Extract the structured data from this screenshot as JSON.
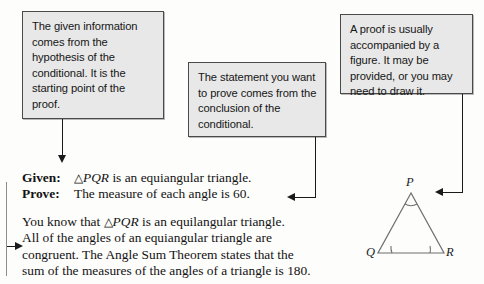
{
  "callouts": {
    "given_note": "The given information comes from the hypothesis of the conditional. It is the starting point of the proof.",
    "prove_note": "The statement you want to prove comes from the conclusion of the conditional.",
    "figure_note": "A proof is usually accompanied by a figure. It may be provided, or you may need to draw it."
  },
  "statement": {
    "given_label": "Given:",
    "given_text_pre": "△",
    "given_text_var": "PQR",
    "given_text_post": " is an equiangular triangle.",
    "prove_label": "Prove:",
    "prove_text": "The measure of each angle is 60."
  },
  "paragraph": {
    "line1_pre": "You know that ",
    "line1_sym": "△",
    "line1_var": "PQR",
    "line1_post": " is an equilangular triangle.",
    "line2": "All of the angles of an equiangular triangle are",
    "line3": "congruent. The Angle Sum Theorem states that the",
    "line4": "sum of the measures of the angles of a triangle is 180."
  },
  "figure": {
    "vertex_p": "P",
    "vertex_q": "Q",
    "vertex_r": "R"
  },
  "colors": {
    "box_fill": "#e8e8e8",
    "box_border": "#4a4a4a",
    "stroke": "#1a1a1a",
    "rail": "#8c8c8c",
    "figure_line": "#6e6e6e",
    "page_bg": "#fdfdfc"
  }
}
